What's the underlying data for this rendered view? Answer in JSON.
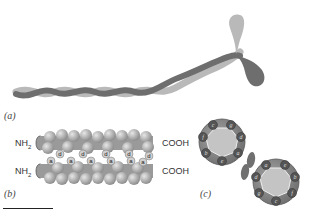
{
  "figure": {
    "panels": [
      {
        "id": "a",
        "label": "(a)",
        "description": "Two-stranded coiled coil with globular heads"
      },
      {
        "id": "b",
        "label": "(b)",
        "description": "Side view of coiled-coil packing with a and d positions",
        "terminals": {
          "n_top": "NH",
          "n_top_sub": "2",
          "n_bottom": "NH",
          "n_bottom_sub": "2",
          "c_top": "COOH",
          "c_bottom": "COOH"
        },
        "heptad_labels_top": [
          "d",
          "d",
          "d",
          "d",
          "d"
        ],
        "heptad_labels_bottom": [
          "a",
          "a",
          "a",
          "a",
          "a",
          "a"
        ]
      },
      {
        "id": "c",
        "label": "(c)",
        "description": "End-on helical wheel view of two helices",
        "wheel_1": [
          "c",
          "g",
          "f",
          "d",
          "b",
          "e",
          "a"
        ],
        "wheel_2": [
          "a",
          "e",
          "b",
          "d",
          "f",
          "g",
          "c"
        ]
      }
    ],
    "colors": {
      "light_strand": "#b9b9b9",
      "dark_strand": "#6e6e6e",
      "sphere": "#a8a8a8",
      "wheel_fill": "#8a8a8a",
      "wheel_core": "#c4c4c4"
    }
  }
}
